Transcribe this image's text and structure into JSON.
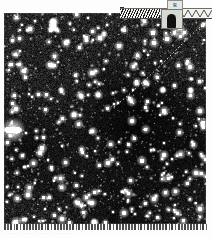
{
  "figure": {
    "kind": "astronomical-plate-scan",
    "alt_description": "Dense star field photographic plate with dotted trajectory line and scan artifact band",
    "plate": {
      "background_color": "#0d0d0d",
      "star_color": "#ffffff",
      "frame_left": 4,
      "frame_top": 13,
      "frame_width": 202,
      "frame_height": 211,
      "star_count": 1500,
      "bright_star": {
        "label": "saturated-star",
        "x": 13,
        "y": 130,
        "width": 13,
        "height": 6
      }
    },
    "trajectory": {
      "name": "dotted-path",
      "color": "#d9d4c4",
      "dash": "1 3",
      "width": 1,
      "path": "M 114 107 C 128 96, 150 76, 170 56 C 182 44, 196 30, 208 20"
    },
    "artifact_band": {
      "label": "scan-artifact-band",
      "left": 120,
      "top": 8,
      "width": 92,
      "height": 9,
      "fill_color": "#e9e9e6",
      "hatch_color": "#1b1b1b",
      "zigzag_color": "#3a3a38"
    },
    "label_tab": {
      "name": "label-tab",
      "text": "R",
      "left": 167,
      "top": 0,
      "background_color": "#e6e6e2",
      "border_color": "#8d8d8a"
    },
    "arch_marker": {
      "name": "arch-marker",
      "left": 161,
      "top": 9,
      "box_color": "#d8d8d4",
      "shape_color": "#111111"
    },
    "caption": {
      "text": "· ·  ··   ·  · ···  · ·   ··  · ··  ·   ·· ·  ···",
      "legible": false
    }
  }
}
